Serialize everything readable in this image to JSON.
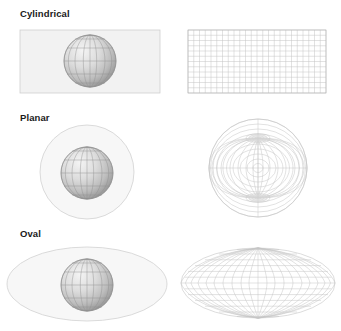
{
  "diagram": {
    "title_visible": false,
    "background_color": "#ffffff",
    "surface_fill": "#f2f2f2",
    "surface_stroke": "#cfcfcf",
    "graticule_stroke": "#c8c8c8",
    "globe_stroke": "#8f8f8f",
    "globe_light": "#ededed",
    "globe_dark": "#9a9a9a",
    "label_color": "#1a1a1a",
    "rows": [
      {
        "id": "cylindrical",
        "label": "Cylindrical",
        "surface_shape": "rectangle",
        "projection_shape": "rectangular-grid",
        "meridians": 24,
        "parallels": 12
      },
      {
        "id": "planar",
        "label": "Planar",
        "surface_shape": "circle",
        "projection_shape": "azimuthal-circle",
        "meridians": 24,
        "parallels": 12
      },
      {
        "id": "oval",
        "label": "Oval",
        "surface_shape": "ellipse",
        "projection_shape": "elliptical-mollweide",
        "meridians": 24,
        "parallels": 12
      }
    ],
    "globe": {
      "meridians": 12,
      "parallels": 8,
      "description": "shaded sphere with latitude-longitude graticule"
    }
  }
}
